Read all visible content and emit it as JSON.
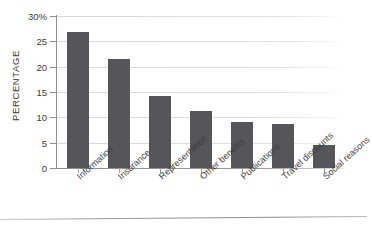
{
  "chart_data": {
    "type": "bar",
    "title": "",
    "xlabel": "",
    "ylabel": "PERCENTAGE",
    "ylim": [
      0,
      30
    ],
    "grid": true,
    "legend": null,
    "y_unit": "%",
    "categories": [
      "Information",
      "Insurance",
      "Representation",
      "Other benefits",
      "Publications",
      "Travel discounts",
      "Social reasons"
    ],
    "values": [
      26.8,
      21.6,
      14.3,
      11.2,
      9.0,
      8.7,
      4.5
    ],
    "y_ticks": [
      {
        "value": 30,
        "label": "30%"
      },
      {
        "value": 25,
        "label": "25"
      },
      {
        "value": 20,
        "label": "20"
      },
      {
        "value": 15,
        "label": "15"
      },
      {
        "value": 10,
        "label": "10"
      },
      {
        "value": 5,
        "label": "5"
      },
      {
        "value": 0,
        "label": "0"
      }
    ],
    "bar_color": "#56565a",
    "gridline_color": "#d9d9d9",
    "axis_color": "#8f8f8f",
    "background_color": "#ffffff"
  }
}
